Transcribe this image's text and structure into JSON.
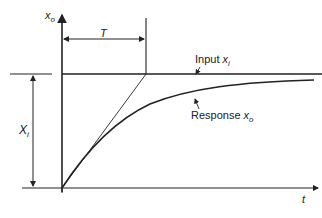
{
  "diagram": {
    "axes": {
      "y_label": "x",
      "y_label_sub": "o",
      "x_label": "t"
    },
    "dimension_T": "T",
    "step_height_label": "X",
    "step_height_sub": "i",
    "input_label": "Input ",
    "input_var": "x",
    "input_sub": "i",
    "response_label": "Response ",
    "response_var": "x",
    "response_sub": "o",
    "colors": {
      "line": "#222222",
      "background": "#ffffff"
    }
  }
}
